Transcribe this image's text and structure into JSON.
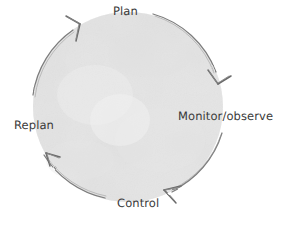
{
  "canvas": {
    "width": 291,
    "height": 225,
    "background_color": "#ffffff"
  },
  "diagram": {
    "type": "cyclic-process-diagram",
    "style": "hand-drawn pencil sketch on paper",
    "direction": "clockwise",
    "stroke_color": "#7a7a7a",
    "text_color": "#3a3a3a",
    "fill_color": "#f4f4f4",
    "circle": {
      "center_x": 128,
      "center_y": 107,
      "radius": 95
    },
    "labels": [
      {
        "id": "plan",
        "text": "Plan",
        "position": "top"
      },
      {
        "id": "monitor",
        "text": "Monitor/observe",
        "position": "right"
      },
      {
        "id": "control",
        "text": "Control",
        "position": "bottom"
      },
      {
        "id": "replan",
        "text": "Replan",
        "position": "left"
      }
    ],
    "arrows": [
      {
        "id": "arrow-to-plan",
        "points_to": "Plan",
        "direction": "up-right",
        "location": "top-left"
      },
      {
        "id": "arrow-to-monitor",
        "points_to": "Monitor/observe",
        "direction": "down",
        "location": "upper-right"
      },
      {
        "id": "arrow-to-control",
        "points_to": "Control",
        "direction": "down-left",
        "location": "bottom-right"
      },
      {
        "id": "arrow-to-replan",
        "points_to": "Replan",
        "direction": "up-left",
        "location": "lower-left"
      }
    ]
  }
}
